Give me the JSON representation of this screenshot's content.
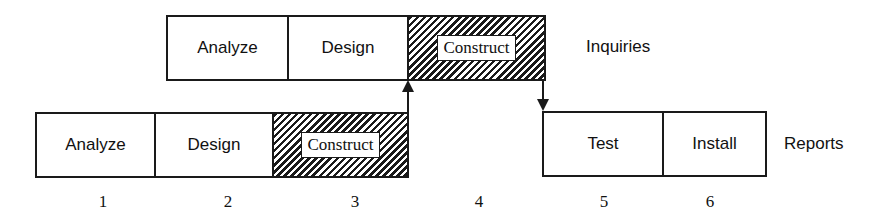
{
  "diagram": {
    "rows": [
      {
        "name": "Inquiries",
        "phases": [
          {
            "label": "Analyze",
            "hatched": false
          },
          {
            "label": "Design",
            "hatched": false
          },
          {
            "label": "Construct",
            "hatched": true
          }
        ]
      },
      {
        "name": "Reports",
        "phases": [
          {
            "label": "Analyze",
            "hatched": false
          },
          {
            "label": "Design",
            "hatched": false
          },
          {
            "label": "Construct",
            "hatched": true
          },
          {
            "label": "Test",
            "hatched": false
          },
          {
            "label": "Install",
            "hatched": false
          }
        ]
      }
    ],
    "periods": [
      "1",
      "2",
      "3",
      "4",
      "5",
      "6"
    ],
    "connections": [
      {
        "from": "Reports.Construct",
        "to": "Inquiries.Construct",
        "direction": "up"
      },
      {
        "from": "Inquiries.Construct",
        "to": "Reports.Test",
        "direction": "down"
      }
    ]
  }
}
